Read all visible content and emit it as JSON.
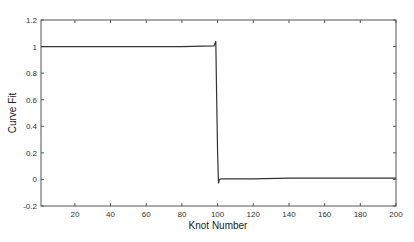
{
  "chart_data": {
    "type": "line",
    "title": "",
    "xlabel": "Knot Number",
    "ylabel": "Curve Fit",
    "xlim": [
      1,
      200
    ],
    "ylim": [
      -0.2,
      1.2
    ],
    "grid": false,
    "legend": null,
    "x_ticks": [
      20,
      40,
      60,
      80,
      100,
      120,
      140,
      160,
      180,
      200
    ],
    "y_ticks": [
      -0.2,
      0,
      0.2,
      0.4,
      0.6,
      0.8,
      1,
      1.2
    ],
    "x_tick_labels": [
      "20",
      "40",
      "60",
      "80",
      "100",
      "120",
      "140",
      "160",
      "180",
      "200"
    ],
    "y_tick_labels": [
      "-0.2",
      "0",
      "0.2",
      "0.4",
      "0.6",
      "0.8",
      "1",
      "1.2"
    ],
    "series": [
      {
        "name": "Curve Fit",
        "color": "#333333",
        "x": [
          1,
          20,
          40,
          60,
          80,
          98,
          99,
          99.5,
          100,
          100.5,
          101,
          102,
          120,
          140,
          160,
          180,
          200
        ],
        "y": [
          1.0,
          1.0,
          1.0,
          1.0,
          1.0,
          1.005,
          1.04,
          0.6,
          0.2,
          -0.03,
          0.0,
          0.005,
          0.005,
          0.01,
          0.01,
          0.01,
          0.01
        ]
      }
    ]
  }
}
